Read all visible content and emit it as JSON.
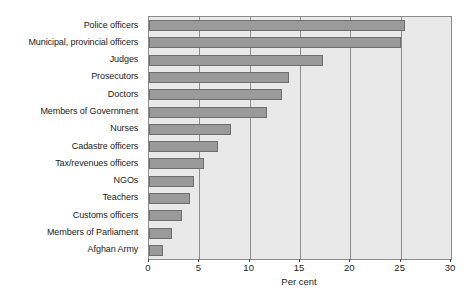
{
  "chart_data": {
    "type": "bar",
    "orientation": "horizontal",
    "title": "",
    "subtitle": "",
    "xlabel": "Per cent",
    "ylabel": "",
    "xlim": [
      0,
      30
    ],
    "xticks": [
      0,
      5,
      10,
      15,
      20,
      25,
      30
    ],
    "xtick_labels": [
      "0",
      "5",
      "10",
      "15",
      "20",
      "25",
      "30"
    ],
    "grid": true,
    "legend": null,
    "categories": [
      "Police officers",
      "Municipal, provincial officers",
      "Judges",
      "Prosecutors",
      "Doctors",
      "Members of Government",
      "Nurses",
      "Cadastre officers",
      "Tax/revenues officers",
      "NGOs",
      "Teachers",
      "Customs officers",
      "Members of Parliament",
      "Afghan Army"
    ],
    "values": [
      25.4,
      25.0,
      17.3,
      13.9,
      13.2,
      11.7,
      8.1,
      6.9,
      5.5,
      4.5,
      4.1,
      3.3,
      2.3,
      1.4
    ],
    "colors": {
      "bar_fill": "#9a9a9a",
      "bar_stroke": "#6e6e6e",
      "plot_background": "#e9e9e9",
      "grid_line": "#8c8c8c",
      "text": "#1c1c1c",
      "page_background": "#ffffff"
    }
  }
}
